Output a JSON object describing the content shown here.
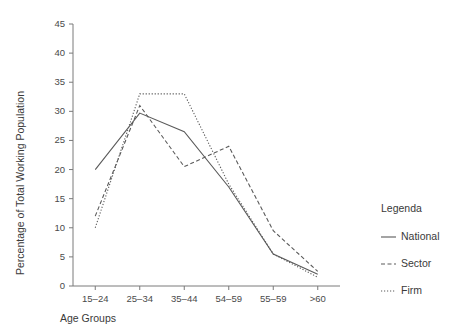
{
  "chart_data": {
    "type": "line",
    "title": "",
    "xlabel": "Age Groups",
    "ylabel": "Percentage of Total Working Population",
    "categories": [
      "15–24",
      "25–34",
      "35–44",
      "54–59",
      "55–59",
      ">60"
    ],
    "ylim": [
      0,
      45
    ],
    "yticks": [
      0,
      5,
      10,
      15,
      20,
      25,
      30,
      35,
      40,
      45
    ],
    "ytick_labels": [
      "0",
      "5",
      "10",
      "15",
      "20",
      "25",
      "30",
      "35",
      "40",
      "45"
    ],
    "grid": false,
    "legend_position": "right",
    "legend_title": "Legenda",
    "series": [
      {
        "name": "National",
        "linestyle": "solid",
        "color": "#5a5a5a",
        "values": [
          20,
          29.7,
          26.5,
          17,
          5.5,
          2
        ]
      },
      {
        "name": "Sector",
        "linestyle": "dashed",
        "color": "#5a5a5a",
        "values": [
          12,
          31,
          20.5,
          24,
          9.5,
          2.5
        ]
      },
      {
        "name": "Firm",
        "linestyle": "dotted",
        "color": "#5a5a5a",
        "values": [
          10,
          33,
          33,
          17.5,
          5.5,
          1.5
        ]
      }
    ]
  },
  "legend": {
    "title": "Legenda",
    "items": [
      {
        "label": "National",
        "style": "solid"
      },
      {
        "label": "Sector",
        "style": "dashed"
      },
      {
        "label": "Firm",
        "style": "dotted"
      }
    ]
  },
  "axes": {
    "x_title": "Age Groups",
    "y_title": "Percentage of Total Working Population"
  }
}
